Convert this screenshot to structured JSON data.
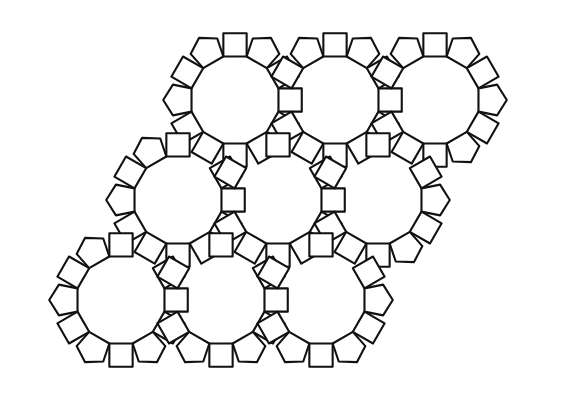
{
  "figure": {
    "background_color": "#ffffff",
    "stroke_color": "#111111",
    "stroke_width": 2.1,
    "fill_color": "#ffffff",
    "canvas": {
      "width": 562,
      "height": 403
    }
  },
  "geometry": {
    "ring_radius": 45,
    "ring_sides": 12,
    "square_side": 26,
    "row_spacing_x": 100,
    "row_spacing_y": 100,
    "row_offset_x": -57,
    "ring_centers": [
      {
        "id": "ring-r1c1",
        "cx": 235,
        "cy": 100
      },
      {
        "id": "ring-r1c2",
        "cx": 335,
        "cy": 100
      },
      {
        "id": "ring-r1c3",
        "cx": 435,
        "cy": 100
      },
      {
        "id": "ring-r2c1",
        "cx": 178,
        "cy": 200
      },
      {
        "id": "ring-r2c2",
        "cx": 278,
        "cy": 200
      },
      {
        "id": "ring-r2c3",
        "cx": 378,
        "cy": 200
      },
      {
        "id": "ring-r3c1",
        "cx": 121,
        "cy": 300
      },
      {
        "id": "ring-r3c2",
        "cx": 221,
        "cy": 300
      },
      {
        "id": "ring-r3c3",
        "cx": 321,
        "cy": 300
      }
    ],
    "neighbor_links": [
      [
        0,
        1
      ],
      [
        1,
        2
      ],
      [
        3,
        4
      ],
      [
        4,
        5
      ],
      [
        6,
        7
      ],
      [
        7,
        8
      ],
      [
        0,
        3
      ],
      [
        1,
        4
      ],
      [
        2,
        5
      ],
      [
        3,
        6
      ],
      [
        4,
        7
      ],
      [
        5,
        8
      ],
      [
        0,
        4
      ],
      [
        1,
        5
      ],
      [
        3,
        7
      ],
      [
        4,
        8
      ]
    ]
  },
  "legend": {
    "shapes": [
      {
        "name": "dodecagon-ring",
        "label": "12-gon ring",
        "count": 9
      },
      {
        "name": "square",
        "label": "Square",
        "count": 40
      },
      {
        "name": "pentagon",
        "label": "Pentagon",
        "count": 52
      },
      {
        "name": "hexagon",
        "label": "Hexagon",
        "count": 14
      }
    ]
  }
}
